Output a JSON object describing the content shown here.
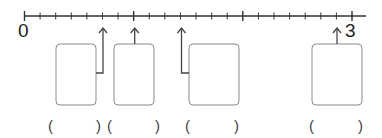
{
  "number_line": {
    "start_label": "0",
    "end_label": "3",
    "min": 0,
    "max": 3,
    "subdivisions_per_unit": 7,
    "line_color": "#333333"
  },
  "arrows": [
    {
      "position_sevenths": 5,
      "box_index": 0,
      "connector": "right"
    },
    {
      "position_sevenths": 7,
      "box_index": 1,
      "connector": "top"
    },
    {
      "position_sevenths": 10,
      "box_index": 2,
      "connector": "left"
    },
    {
      "position_sevenths": 20,
      "box_index": 3,
      "connector": "top"
    }
  ],
  "boxes": [
    {
      "label": "",
      "answer_blank": ""
    },
    {
      "label": "",
      "answer_blank": ""
    },
    {
      "label": "",
      "answer_blank": ""
    },
    {
      "label": "",
      "answer_blank": ""
    }
  ],
  "answer_slots": [
    {
      "open": "(",
      "close": ")"
    },
    {
      "open": "(",
      "close": ")"
    },
    {
      "open": "(",
      "close": ")"
    },
    {
      "open": "(",
      "close": ")"
    }
  ],
  "colors": {
    "line": "#333333",
    "box_border": "#888888",
    "text": "#222222"
  }
}
